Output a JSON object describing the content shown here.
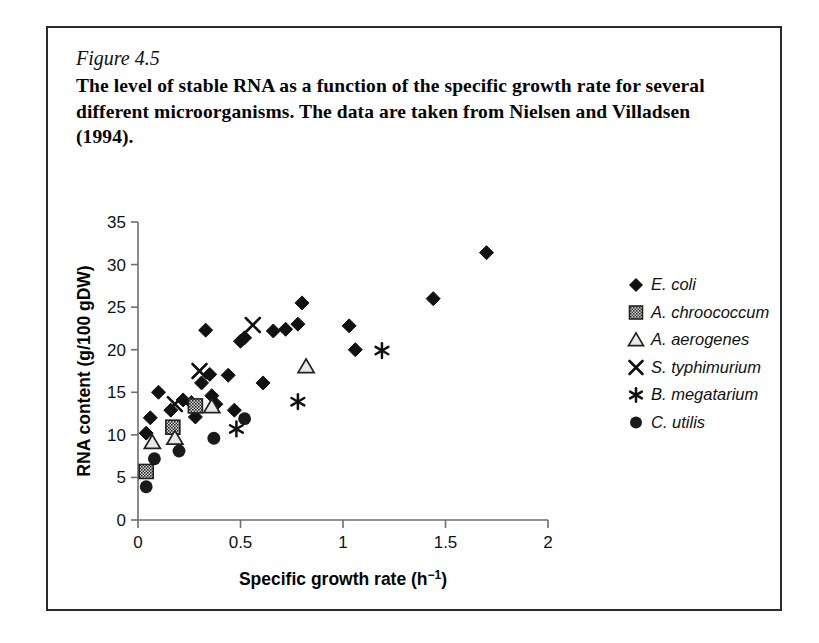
{
  "caption": {
    "figure_number": "Figure 4.5",
    "text": "The level of stable RNA as a function of the specific growth rate for several different microorganisms. The data are taken from Nielsen and Villadsen (1994)."
  },
  "chart_data": {
    "type": "scatter",
    "title": "",
    "xlabel": "Specific growth rate (h−1)",
    "ylabel": "RNA content (g/100 gDW)",
    "xlim": [
      0,
      2
    ],
    "ylim": [
      0,
      35
    ],
    "xticks": [
      "0",
      "0.5",
      "1",
      "1.5",
      "2"
    ],
    "xtick_values": [
      0,
      0.5,
      1,
      1.5,
      2
    ],
    "yticks": [
      "0",
      "5",
      "10",
      "15",
      "20",
      "25",
      "30",
      "35"
    ],
    "ytick_values": [
      0,
      5,
      10,
      15,
      20,
      25,
      30,
      35
    ],
    "grid": false,
    "legend_position": "right",
    "series": [
      {
        "name": "E. coli",
        "marker": "filled-diamond",
        "color": "#111111",
        "points": [
          [
            0.04,
            10.2
          ],
          [
            0.06,
            12.0
          ],
          [
            0.1,
            15.0
          ],
          [
            0.16,
            12.9
          ],
          [
            0.22,
            14.1
          ],
          [
            0.26,
            13.8
          ],
          [
            0.28,
            12.1
          ],
          [
            0.31,
            16.1
          ],
          [
            0.33,
            22.3
          ],
          [
            0.35,
            17.1
          ],
          [
            0.36,
            14.6
          ],
          [
            0.38,
            13.6
          ],
          [
            0.44,
            17.0
          ],
          [
            0.47,
            12.9
          ],
          [
            0.5,
            21.0
          ],
          [
            0.52,
            21.4
          ],
          [
            0.61,
            16.1
          ],
          [
            0.66,
            22.2
          ],
          [
            0.72,
            22.4
          ],
          [
            0.78,
            23.0
          ],
          [
            0.8,
            25.5
          ],
          [
            1.03,
            22.8
          ],
          [
            1.06,
            20.0
          ],
          [
            1.44,
            26.0
          ],
          [
            1.7,
            31.4
          ]
        ]
      },
      {
        "name": "A. chroococcum",
        "marker": "hatched-square",
        "color": "#3a3a3a",
        "points": [
          [
            0.04,
            5.7
          ],
          [
            0.17,
            10.9
          ],
          [
            0.28,
            13.4
          ]
        ]
      },
      {
        "name": "A. aerogenes",
        "marker": "open-triangle",
        "color": "#111111",
        "points": [
          [
            0.07,
            9.1
          ],
          [
            0.18,
            9.6
          ],
          [
            0.36,
            13.3
          ],
          [
            0.82,
            18.0
          ]
        ]
      },
      {
        "name": "S. typhimurium",
        "marker": "cross-x",
        "color": "#111111",
        "points": [
          [
            0.18,
            13.6
          ],
          [
            0.3,
            17.5
          ],
          [
            0.56,
            22.9
          ]
        ]
      },
      {
        "name": "B. megatarium",
        "marker": "asterisk",
        "color": "#111111",
        "points": [
          [
            0.48,
            10.7
          ],
          [
            0.78,
            13.9
          ],
          [
            1.19,
            19.9
          ]
        ]
      },
      {
        "name": "C. utilis",
        "marker": "filled-circle",
        "color": "#1a1a1a",
        "points": [
          [
            0.04,
            3.9
          ],
          [
            0.08,
            7.2
          ],
          [
            0.2,
            8.1
          ],
          [
            0.37,
            9.6
          ],
          [
            0.52,
            11.9
          ]
        ]
      }
    ]
  }
}
